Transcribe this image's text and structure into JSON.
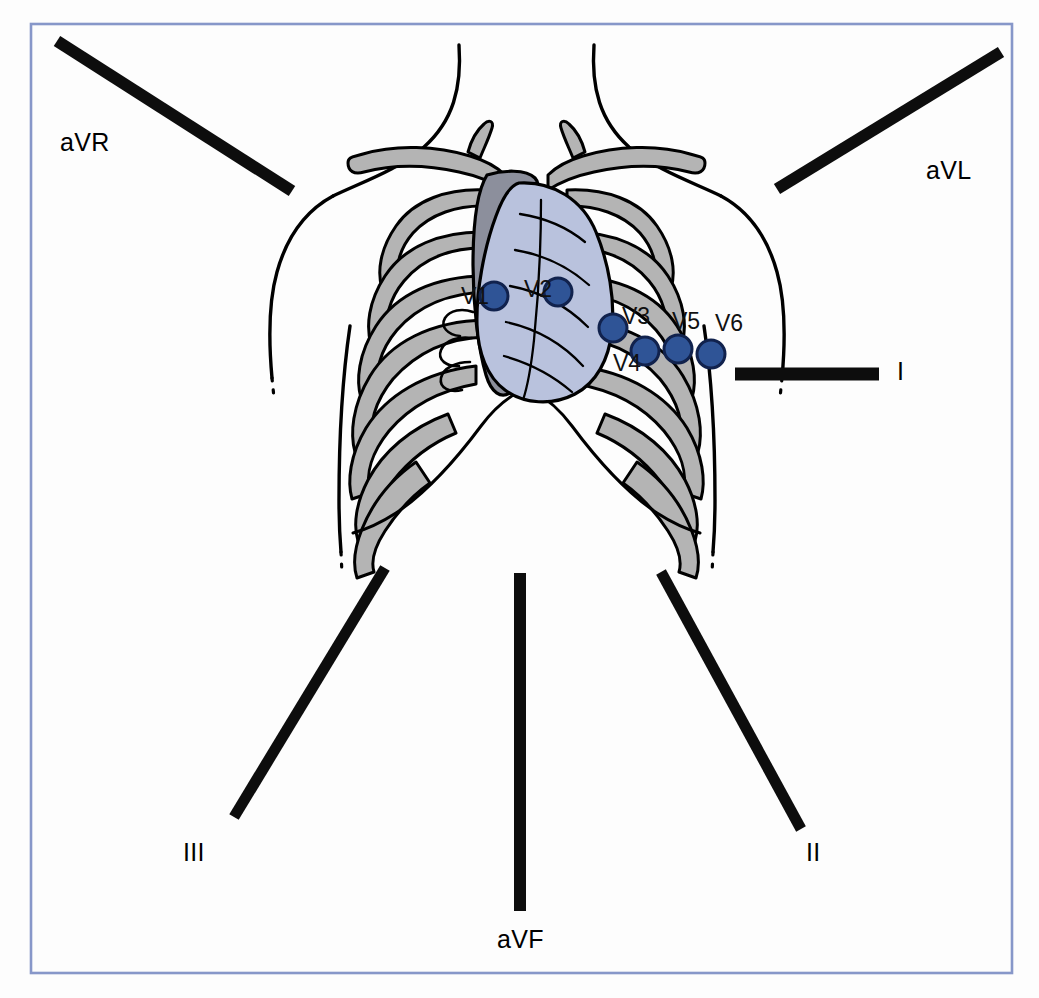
{
  "figure": {
    "frame_color": "#8797c9",
    "background_color": "#fdfdfd",
    "bar_color": "#0d0d0d",
    "electrode_fill": "#2f5496",
    "electrode_stroke": "#11224d",
    "bone_fill": "#b4b4b4",
    "sternum_fill": "#8c8f9c",
    "heart_fill": "#b9c2dd",
    "outline_color": "#000000"
  },
  "limb_leads": [
    {
      "id": "aVR",
      "label": "aVR",
      "label_x": 60,
      "label_y": 128,
      "bar": {
        "x1": 57,
        "y1": 41,
        "x2": 292,
        "y2": 191,
        "width": 12
      }
    },
    {
      "id": "aVL",
      "label": "aVL",
      "label_x": 926,
      "label_y": 156,
      "bar": {
        "x1": 777,
        "y1": 189,
        "x2": 1001,
        "y2": 52,
        "width": 12
      }
    },
    {
      "id": "I",
      "label": "I",
      "label_x": 897,
      "label_y": 357,
      "bar": {
        "x1": 735,
        "y1": 374,
        "x2": 879,
        "y2": 374,
        "width": 13
      }
    },
    {
      "id": "III",
      "label": "III",
      "label_x": 183,
      "label_y": 838,
      "bar": {
        "x1": 385,
        "y1": 568,
        "x2": 234,
        "y2": 817,
        "width": 11
      }
    },
    {
      "id": "aVF",
      "label": "aVF",
      "label_x": 497,
      "label_y": 925,
      "bar": {
        "x1": 520,
        "y1": 573,
        "x2": 520,
        "y2": 911,
        "width": 12
      }
    },
    {
      "id": "II",
      "label": "II",
      "label_x": 806,
      "label_y": 838,
      "bar": {
        "x1": 661,
        "y1": 572,
        "x2": 801,
        "y2": 829,
        "width": 11
      }
    }
  ],
  "chest_electrodes": [
    {
      "id": "V1",
      "label": "V1",
      "cx": 494,
      "cy": 296,
      "r": 14,
      "label_x": 461,
      "label_y": 283
    },
    {
      "id": "V2",
      "label": "V2",
      "cx": 558,
      "cy": 292,
      "r": 14,
      "label_x": 524,
      "label_y": 276
    },
    {
      "id": "V3",
      "label": "V3",
      "cx": 613,
      "cy": 328,
      "r": 14,
      "label_x": 622,
      "label_y": 303
    },
    {
      "id": "V4",
      "label": "V4",
      "cx": 645,
      "cy": 351,
      "r": 14,
      "label_x": 613,
      "label_y": 350
    },
    {
      "id": "V5",
      "label": "V5",
      "cx": 678,
      "cy": 349,
      "r": 14,
      "label_x": 672,
      "label_y": 308
    },
    {
      "id": "V6",
      "label": "V6",
      "cx": 711,
      "cy": 354,
      "r": 14,
      "label_x": 715,
      "label_y": 310
    }
  ],
  "anatomy": {
    "parts": [
      "torso-outline",
      "left-arm-outline",
      "right-arm-outline",
      "clavicle-left",
      "clavicle-right",
      "sternum",
      "heart",
      "ribcage-left",
      "ribcage-right",
      "costal-margin"
    ]
  }
}
